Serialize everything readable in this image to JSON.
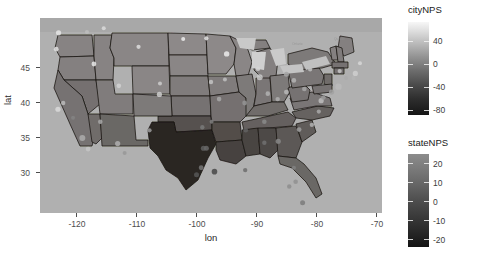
{
  "chart_data": {
    "type": "map",
    "subtype": "choropleth-with-points",
    "title": "",
    "xlabel": "lon",
    "ylabel": "lat",
    "xlim": [
      -125.5,
      -66.5
    ],
    "ylim": [
      24.5,
      49.5
    ],
    "xticks": [
      "-120",
      "-110",
      "-100",
      "-90",
      "-80",
      "-70"
    ],
    "xtick_values": [
      -120,
      -110,
      -100,
      -90,
      -80,
      -70
    ],
    "yticks": [
      "45",
      "40",
      "35",
      "30"
    ],
    "ytick_values": [
      45,
      40,
      35,
      30
    ],
    "grid": false,
    "panel_background": "#b3b3b3",
    "legends": [
      {
        "name": "cityNPS",
        "type": "continuous-colorbar",
        "position": "right-top",
        "ticks": [
          "40",
          "0",
          "-40",
          "-80"
        ],
        "tick_values": [
          40,
          0,
          -40,
          -80
        ],
        "range": [
          -100,
          60
        ],
        "low_color": "#111111",
        "high_color": "#f7f7f7"
      },
      {
        "name": "stateNPS",
        "type": "continuous-colorbar",
        "position": "right-bottom",
        "ticks": [
          "20",
          "10",
          "0",
          "-10",
          "-20"
        ],
        "tick_values": [
          20,
          10,
          0,
          -10,
          -20
        ],
        "range": [
          -26,
          26
        ],
        "low_color": "#131313",
        "high_color": "#8c8c8c"
      }
    ],
    "state_values": [
      {
        "state": "Texas",
        "stateNPS": -24,
        "fill": "#2a2523"
      },
      {
        "state": "Louisiana",
        "stateNPS": -12,
        "fill": "#474241"
      },
      {
        "state": "Mississippi",
        "stateNPS": -11,
        "fill": "#4a4543"
      },
      {
        "state": "Alabama",
        "stateNPS": -10,
        "fill": "#4e4947"
      },
      {
        "state": "Arkansas",
        "stateNPS": -9,
        "fill": "#524d4a"
      },
      {
        "state": "Oklahoma",
        "stateNPS": -8,
        "fill": "#565150"
      },
      {
        "state": "Georgia",
        "stateNPS": -6,
        "fill": "#5c5856"
      },
      {
        "state": "South Carolina",
        "stateNPS": -5,
        "fill": "#605c5a"
      },
      {
        "state": "Tennessee",
        "stateNPS": -4,
        "fill": "#65605e"
      },
      {
        "state": "Florida",
        "stateNPS": -2,
        "fill": "#6b6765"
      },
      {
        "state": "New Mexico",
        "stateNPS": -2,
        "fill": "#6b6765"
      },
      {
        "state": "Arizona",
        "stateNPS": 0,
        "fill": "#706c6a"
      },
      {
        "state": "Nevada",
        "stateNPS": 1,
        "fill": "#747070"
      },
      {
        "state": "California",
        "stateNPS": 2,
        "fill": "#767272"
      },
      {
        "state": "Kansas",
        "stateNPS": 2,
        "fill": "#767272"
      },
      {
        "state": "Missouri",
        "stateNPS": 1,
        "fill": "#747070"
      },
      {
        "state": "Kentucky",
        "stateNPS": 0,
        "fill": "#706c6a"
      },
      {
        "state": "North Carolina",
        "stateNPS": -3,
        "fill": "#666260"
      },
      {
        "state": "Virginia",
        "stateNPS": 3,
        "fill": "#7a7676"
      },
      {
        "state": "West Virginia",
        "stateNPS": 2,
        "fill": "#767272"
      },
      {
        "state": "Ohio",
        "stateNPS": 4,
        "fill": "#7d7a79"
      },
      {
        "state": "Indiana",
        "stateNPS": 3,
        "fill": "#7a7676"
      },
      {
        "state": "Illinois",
        "stateNPS": 4,
        "fill": "#7d7a79"
      },
      {
        "state": "Iowa",
        "stateNPS": 5,
        "fill": "#807c7b"
      },
      {
        "state": "Nebraska",
        "stateNPS": 5,
        "fill": "#807c7b"
      },
      {
        "state": "Colorado",
        "stateNPS": 4,
        "fill": "#7d7a79"
      },
      {
        "state": "Utah",
        "stateNPS": 5,
        "fill": "#807c7b"
      },
      {
        "state": "Oregon",
        "stateNPS": 6,
        "fill": "#848080"
      },
      {
        "state": "Washington",
        "stateNPS": 7,
        "fill": "#878383"
      },
      {
        "state": "Idaho",
        "stateNPS": 7,
        "fill": "#878383"
      },
      {
        "state": "Montana",
        "stateNPS": 8,
        "fill": "#8a8686"
      },
      {
        "state": "Wyoming",
        "stateNPS": 8,
        "fill": "#8a8686"
      },
      {
        "state": "North Dakota",
        "stateNPS": 9,
        "fill": "#8d8989"
      },
      {
        "state": "South Dakota",
        "stateNPS": 8,
        "fill": "#8a8686"
      },
      {
        "state": "Minnesota",
        "stateNPS": 9,
        "fill": "#8d8989"
      },
      {
        "state": "Wisconsin",
        "stateNPS": 8,
        "fill": "#8a8686"
      },
      {
        "state": "Michigan",
        "stateNPS": 6,
        "fill": "#848080"
      },
      {
        "state": "Pennsylvania",
        "stateNPS": 3,
        "fill": "#7a7676"
      },
      {
        "state": "New York",
        "stateNPS": 4,
        "fill": "#7d7a79"
      },
      {
        "state": "Maine",
        "stateNPS": 6,
        "fill": "#848080"
      },
      {
        "state": "Vermont",
        "stateNPS": 6,
        "fill": "#848080"
      },
      {
        "state": "New Hampshire",
        "stateNPS": 5,
        "fill": "#807c7b"
      },
      {
        "state": "Massachusetts",
        "stateNPS": 2,
        "fill": "#767272"
      },
      {
        "state": "Connecticut",
        "stateNPS": 1,
        "fill": "#747070"
      },
      {
        "state": "Rhode Island",
        "stateNPS": 1,
        "fill": "#747070"
      },
      {
        "state": "New Jersey",
        "stateNPS": 0,
        "fill": "#706c6a"
      },
      {
        "state": "Delaware",
        "stateNPS": 1,
        "fill": "#747070"
      },
      {
        "state": "Maryland",
        "stateNPS": 2,
        "fill": "#767272"
      }
    ],
    "city_points": [
      {
        "lon": -122.3,
        "lat": 47.6,
        "cityNPS": 48,
        "r": 2.6
      },
      {
        "lon": -122.7,
        "lat": 45.5,
        "cityNPS": 44,
        "r": 2.4
      },
      {
        "lon": -117.4,
        "lat": 47.7,
        "cityNPS": 20,
        "r": 2.0
      },
      {
        "lon": -116.2,
        "lat": 43.6,
        "cityNPS": 50,
        "r": 2.4
      },
      {
        "lon": -111.9,
        "lat": 40.8,
        "cityNPS": 34,
        "r": 2.3
      },
      {
        "lon": -112.1,
        "lat": 33.4,
        "cityNPS": 10,
        "r": 2.6
      },
      {
        "lon": -110.9,
        "lat": 32.2,
        "cityNPS": -6,
        "r": 2.0
      },
      {
        "lon": -115.1,
        "lat": 36.2,
        "cityNPS": 4,
        "r": 2.3
      },
      {
        "lon": -121.5,
        "lat": 38.6,
        "cityNPS": 18,
        "r": 2.2
      },
      {
        "lon": -122.4,
        "lat": 37.8,
        "cityNPS": 40,
        "r": 2.6
      },
      {
        "lon": -119.8,
        "lat": 36.7,
        "cityNPS": -20,
        "r": 2.0
      },
      {
        "lon": -118.2,
        "lat": 34.1,
        "cityNPS": 8,
        "r": 3.0
      },
      {
        "lon": -117.2,
        "lat": 32.7,
        "cityNPS": 26,
        "r": 2.4
      },
      {
        "lon": -104.9,
        "lat": 39.7,
        "cityNPS": 30,
        "r": 2.6
      },
      {
        "lon": -106.6,
        "lat": 35.1,
        "cityNPS": -4,
        "r": 2.1
      },
      {
        "lon": -97.5,
        "lat": 35.5,
        "cityNPS": -28,
        "r": 2.2
      },
      {
        "lon": -95.9,
        "lat": 36.2,
        "cityNPS": -24,
        "r": 2.0
      },
      {
        "lon": -97.3,
        "lat": 32.8,
        "cityNPS": -46,
        "r": 2.6
      },
      {
        "lon": -96.8,
        "lat": 32.8,
        "cityNPS": -40,
        "r": 2.5
      },
      {
        "lon": -95.4,
        "lat": 29.8,
        "cityNPS": -62,
        "r": 2.8
      },
      {
        "lon": -98.5,
        "lat": 29.4,
        "cityNPS": -52,
        "r": 2.5
      },
      {
        "lon": -97.7,
        "lat": 30.3,
        "cityNPS": -30,
        "r": 2.4
      },
      {
        "lon": -90.1,
        "lat": 30.0,
        "cityNPS": -36,
        "r": 2.2
      },
      {
        "lon": -94.6,
        "lat": 39.1,
        "cityNPS": 6,
        "r": 2.3
      },
      {
        "lon": -90.2,
        "lat": 38.6,
        "cityNPS": -8,
        "r": 2.4
      },
      {
        "lon": -96.0,
        "lat": 41.3,
        "cityNPS": 24,
        "r": 2.2
      },
      {
        "lon": -93.6,
        "lat": 41.6,
        "cityNPS": 22,
        "r": 2.0
      },
      {
        "lon": -93.3,
        "lat": 44.9,
        "cityNPS": 52,
        "r": 2.7
      },
      {
        "lon": -87.9,
        "lat": 43.0,
        "cityNPS": 36,
        "r": 2.3
      },
      {
        "lon": -87.6,
        "lat": 41.9,
        "cityNPS": 28,
        "r": 3.0
      },
      {
        "lon": -86.2,
        "lat": 39.8,
        "cityNPS": 12,
        "r": 2.3
      },
      {
        "lon": -83.0,
        "lat": 42.3,
        "cityNPS": 2,
        "r": 2.5
      },
      {
        "lon": -81.7,
        "lat": 41.5,
        "cityNPS": 14,
        "r": 2.3
      },
      {
        "lon": -83.0,
        "lat": 40.0,
        "cityNPS": 16,
        "r": 2.4
      },
      {
        "lon": -84.5,
        "lat": 39.1,
        "cityNPS": 10,
        "r": 2.2
      },
      {
        "lon": -86.8,
        "lat": 36.2,
        "cityNPS": -16,
        "r": 2.3
      },
      {
        "lon": -90.0,
        "lat": 35.1,
        "cityNPS": -44,
        "r": 2.3
      },
      {
        "lon": -86.8,
        "lat": 33.5,
        "cityNPS": -34,
        "r": 2.2
      },
      {
        "lon": -84.4,
        "lat": 33.7,
        "cityNPS": -18,
        "r": 2.6
      },
      {
        "lon": -81.4,
        "lat": 28.5,
        "cityNPS": -12,
        "r": 2.3
      },
      {
        "lon": -80.2,
        "lat": 25.8,
        "cityNPS": -26,
        "r": 2.5
      },
      {
        "lon": -82.5,
        "lat": 27.9,
        "cityNPS": -14,
        "r": 2.2
      },
      {
        "lon": -81.7,
        "lat": 30.3,
        "cityNPS": -22,
        "r": 2.1
      },
      {
        "lon": -80.8,
        "lat": 35.2,
        "cityNPS": -2,
        "r": 2.4
      },
      {
        "lon": -78.6,
        "lat": 35.8,
        "cityNPS": 12,
        "r": 2.2
      },
      {
        "lon": -77.4,
        "lat": 37.5,
        "cityNPS": 6,
        "r": 2.1
      },
      {
        "lon": -77.0,
        "lat": 38.9,
        "cityNPS": 20,
        "r": 2.6
      },
      {
        "lon": -76.6,
        "lat": 39.3,
        "cityNPS": -4,
        "r": 2.3
      },
      {
        "lon": -75.2,
        "lat": 40.0,
        "cityNPS": 0,
        "r": 2.6
      },
      {
        "lon": -74.0,
        "lat": 40.7,
        "cityNPS": 18,
        "r": 3.2
      },
      {
        "lon": -73.8,
        "lat": 42.7,
        "cityNPS": 26,
        "r": 2.1
      },
      {
        "lon": -71.1,
        "lat": 42.4,
        "cityNPS": 32,
        "r": 2.6
      },
      {
        "lon": -72.7,
        "lat": 41.8,
        "cityNPS": 8,
        "r": 2.0
      },
      {
        "lon": -71.4,
        "lat": 41.8,
        "cityNPS": 14,
        "r": 2.0
      },
      {
        "lon": -79.9,
        "lat": 40.4,
        "cityNPS": 4,
        "r": 2.3
      },
      {
        "lon": -78.9,
        "lat": 42.9,
        "cityNPS": 22,
        "r": 2.1
      },
      {
        "lon": -70.3,
        "lat": 43.7,
        "cityNPS": 38,
        "r": 2.0
      },
      {
        "lon": -100.8,
        "lat": 46.8,
        "cityNPS": 54,
        "r": 2.0
      },
      {
        "lon": -96.8,
        "lat": 46.9,
        "cityNPS": 46,
        "r": 2.1
      },
      {
        "lon": -104.8,
        "lat": 41.1,
        "cityNPS": 30,
        "r": 2.0
      },
      {
        "lon": -108.5,
        "lat": 45.8,
        "cityNPS": 42,
        "r": 2.1
      },
      {
        "lon": -114.5,
        "lat": 48.2,
        "cityNPS": 40,
        "r": 2.0
      }
    ]
  },
  "axes": {
    "x_title": "lon",
    "y_title": "lat"
  },
  "legend_city": {
    "title": "cityNPS",
    "labels": [
      "40",
      "0",
      "-40",
      "-80"
    ]
  },
  "legend_state": {
    "title": "stateNPS",
    "labels": [
      "20",
      "10",
      "0",
      "-10",
      "-20"
    ]
  }
}
